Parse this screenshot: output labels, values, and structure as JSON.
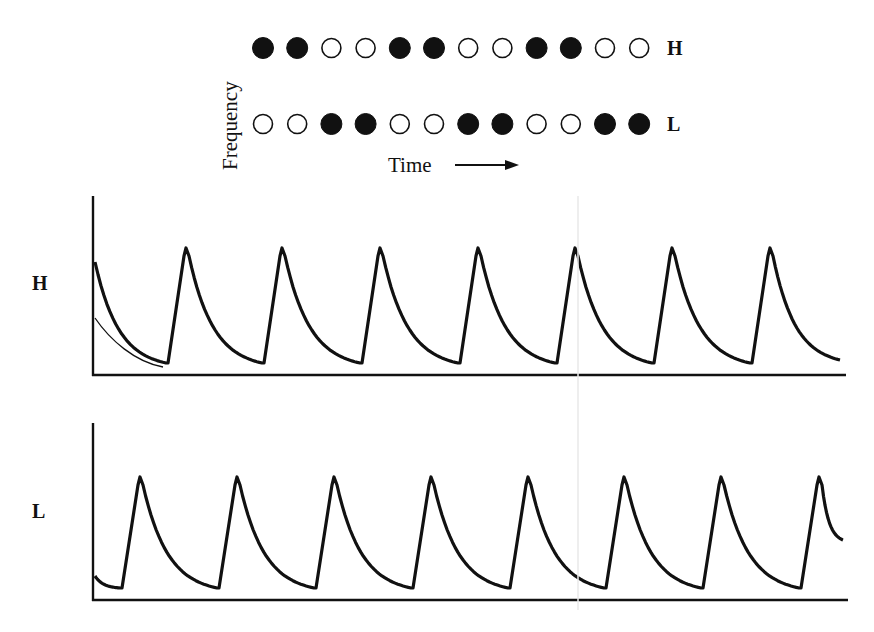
{
  "schematic": {
    "y_axis_label": "Frequency",
    "x_axis_label": "Time",
    "x_axis_arrow": "right-arrow",
    "rows": [
      {
        "label": "H",
        "tones": [
          1,
          1,
          0,
          0,
          1,
          1,
          0,
          0,
          1,
          1,
          0,
          0
        ]
      },
      {
        "label": "L",
        "tones": [
          0,
          0,
          1,
          1,
          0,
          0,
          1,
          1,
          0,
          0,
          1,
          1
        ]
      }
    ],
    "legend": {
      "filled": "tone present",
      "open": "tone absent"
    }
  },
  "plots": [
    {
      "label": "H",
      "cycles": 7
    },
    {
      "label": "L",
      "cycles": 8
    }
  ],
  "chart_data": {
    "type": "line",
    "title": "",
    "xlabel": "Time",
    "ylabel": "",
    "grid": false,
    "series": [
      {
        "name": "H",
        "description": "Sawtooth response: sharp rise, exponential decay; initial decay from start",
        "peak_times_px": [
          186,
          282,
          380,
          478,
          575,
          672,
          770
        ],
        "relative_peak": 1.0,
        "relative_trough": 0.07
      },
      {
        "name": "L",
        "description": "Sawtooth response: sharp rise, exponential decay; starts low",
        "peak_times_px": [
          140,
          237,
          334,
          431,
          528,
          624,
          721,
          819
        ],
        "relative_peak": 1.0,
        "relative_trough": 0.07
      }
    ]
  }
}
